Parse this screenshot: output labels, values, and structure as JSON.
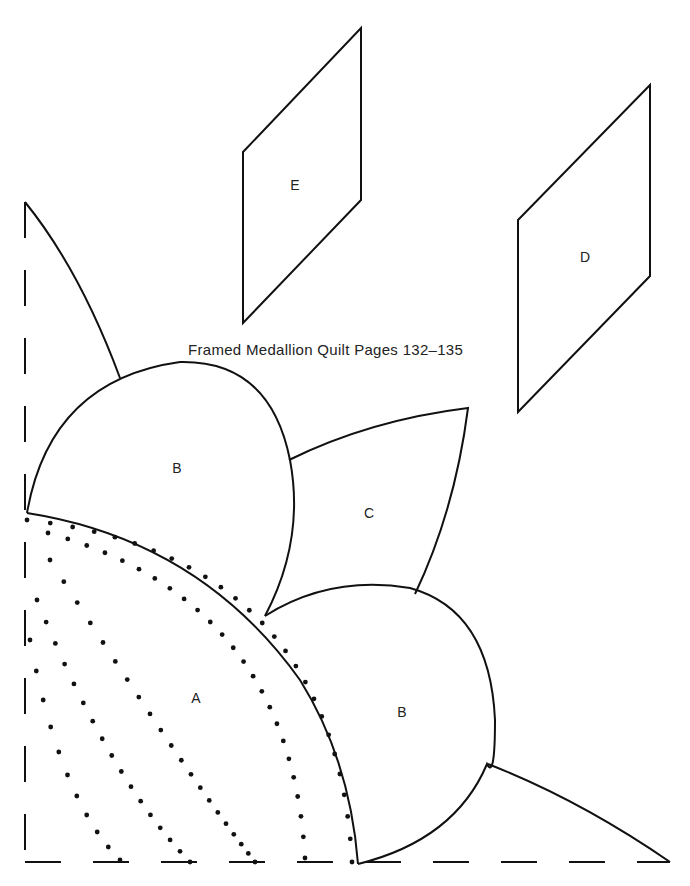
{
  "document": {
    "title": "Framed Medallion Quilt Pages 132–135",
    "pieces": [
      {
        "id": "piece-a",
        "label": "A",
        "note": "quarter-circle with dotted quilting lines"
      },
      {
        "id": "piece-b-upper",
        "label": "B"
      },
      {
        "id": "piece-b-lower",
        "label": "B"
      },
      {
        "id": "piece-c",
        "label": "C"
      },
      {
        "id": "piece-d",
        "label": "D"
      },
      {
        "id": "piece-e",
        "label": "E"
      }
    ],
    "colors": {
      "ink": "#111111",
      "paper": "#ffffff"
    }
  }
}
